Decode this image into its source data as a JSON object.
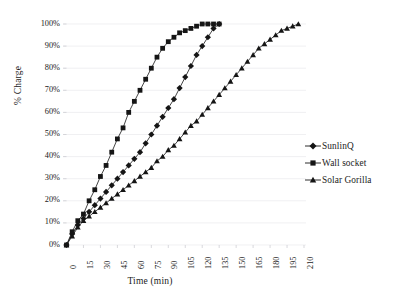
{
  "chart_data": {
    "type": "line",
    "title": "",
    "xlabel": "Time (min)",
    "ylabel": "% Charge",
    "xlim": [
      0,
      210
    ],
    "ylim": [
      0,
      1.0
    ],
    "grid": "horizontal-faint",
    "legend_position": "right",
    "x_ticks": [
      "0",
      "15",
      "30",
      "45",
      "60",
      "75",
      "90",
      "105",
      "120",
      "135",
      "150",
      "165",
      "180",
      "195",
      "210"
    ],
    "x_tick_values": [
      0,
      15,
      30,
      45,
      60,
      75,
      90,
      105,
      120,
      135,
      150,
      165,
      180,
      195,
      210
    ],
    "y_ticks": [
      "0%",
      "10%",
      "20%",
      "30%",
      "40%",
      "50%",
      "60%",
      "70%",
      "80%",
      "90%",
      "100%"
    ],
    "y_tick_values": [
      0,
      10,
      20,
      30,
      40,
      50,
      60,
      70,
      80,
      90,
      100
    ],
    "series": [
      {
        "name": "SunlinQ",
        "marker": "diamond",
        "color": "#151515",
        "x": [
          0,
          5,
          10,
          15,
          20,
          25,
          30,
          35,
          40,
          45,
          50,
          55,
          60,
          65,
          70,
          75,
          80,
          85,
          90,
          95,
          100,
          105,
          110,
          115,
          120,
          125,
          130,
          135
        ],
        "y": [
          0,
          5,
          9,
          12,
          15,
          18,
          21,
          24,
          27,
          30,
          33,
          36,
          39,
          42,
          46,
          50,
          54,
          58,
          62,
          66,
          71,
          76,
          81,
          86,
          90,
          94,
          98,
          100
        ]
      },
      {
        "name": "Wall socket",
        "marker": "square",
        "color": "#151515",
        "x": [
          0,
          5,
          10,
          15,
          20,
          25,
          30,
          35,
          40,
          45,
          50,
          55,
          60,
          65,
          70,
          75,
          80,
          85,
          90,
          95,
          100,
          105,
          110,
          115,
          120,
          125,
          130,
          135
        ],
        "y": [
          0,
          6,
          11,
          14,
          20,
          25,
          31,
          36,
          42,
          48,
          53,
          60,
          65,
          70,
          75,
          80,
          85,
          89,
          92,
          94,
          96,
          97,
          98,
          99,
          100,
          100,
          100,
          100
        ]
      },
      {
        "name": "Solar Gorilla",
        "marker": "triangle",
        "color": "#151515",
        "x": [
          0,
          5,
          10,
          15,
          20,
          25,
          30,
          35,
          40,
          45,
          50,
          55,
          60,
          65,
          70,
          75,
          80,
          85,
          90,
          95,
          100,
          105,
          110,
          115,
          120,
          125,
          130,
          135,
          140,
          145,
          150,
          155,
          160,
          165,
          170,
          175,
          180,
          185,
          190,
          195,
          200,
          205
        ],
        "y": [
          0,
          4,
          8,
          11,
          13,
          15,
          17,
          19,
          21,
          23,
          25,
          27,
          29,
          31,
          33,
          35,
          38,
          40,
          43,
          45,
          48,
          51,
          54,
          56,
          59,
          62,
          65,
          68,
          71,
          74,
          77,
          80,
          83,
          86,
          89,
          91,
          93,
          95,
          97,
          98,
          99,
          100
        ]
      }
    ]
  },
  "legend": {
    "items": [
      {
        "label": "SunlinQ",
        "marker": "diamond"
      },
      {
        "label": "Wall socket",
        "marker": "square"
      },
      {
        "label": "Solar Gorilla",
        "marker": "triangle"
      }
    ]
  }
}
